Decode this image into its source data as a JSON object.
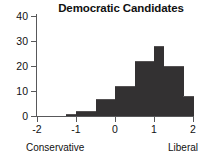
{
  "chart_data": {
    "type": "bar",
    "title": "Democratic Candidates",
    "xlabel": "",
    "ylabel": "",
    "xlim": [
      -2,
      2
    ],
    "ylim": [
      0,
      40
    ],
    "grid": false,
    "legend": null,
    "bin_width": 0.25,
    "bin_starts": [
      -1.25,
      -1.0,
      -0.75,
      -0.5,
      -0.25,
      0.0,
      0.25,
      0.5,
      0.75,
      1.0,
      1.25,
      1.5,
      1.75
    ],
    "categories": [
      "-1.25",
      "-1.00",
      "-0.75",
      "-0.50",
      "-0.25",
      "0.00",
      "0.25",
      "0.50",
      "0.75",
      "1.00",
      "1.25",
      "1.50",
      "1.75"
    ],
    "values": [
      1,
      2,
      2,
      7,
      7,
      12,
      12,
      22,
      22,
      28,
      20,
      20,
      8
    ],
    "x_ticks": [
      {
        "value": -2,
        "label": "-2"
      },
      {
        "value": -1,
        "label": "-1"
      },
      {
        "value": 0,
        "label": "0"
      },
      {
        "value": 1,
        "label": "1"
      },
      {
        "value": 2,
        "label": "2"
      }
    ],
    "y_ticks": [
      {
        "value": 0,
        "label": "0"
      },
      {
        "value": 10,
        "label": "10"
      },
      {
        "value": 20,
        "label": "20"
      },
      {
        "value": 30,
        "label": "30"
      },
      {
        "value": 40,
        "label": "40"
      }
    ],
    "annotations": [
      {
        "name": "left-anchor",
        "text": "Conservative"
      },
      {
        "name": "right-anchor",
        "text": "Liberal"
      }
    ],
    "colors": {
      "bar": "#333132",
      "axis": "#58585a",
      "text": "#111111",
      "background": "#ffffff"
    }
  }
}
